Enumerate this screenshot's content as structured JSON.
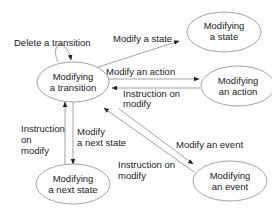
{
  "diagram": {
    "type": "state-transition",
    "colors": {
      "stroke": "#8a8a8a",
      "text": "#222222",
      "arrowhead": "#222222",
      "background": "#ffffff"
    },
    "nodes": [
      {
        "id": "transition",
        "line1": "Modifying",
        "line2": "a transition"
      },
      {
        "id": "state",
        "line1": "Modifying",
        "line2": "a state"
      },
      {
        "id": "action",
        "line1": "Modifying",
        "line2": "an action"
      },
      {
        "id": "next_state",
        "line1": "Modifying",
        "line2": "a next state"
      },
      {
        "id": "event",
        "line1": "Modifying",
        "line2": "an event"
      }
    ],
    "edges": [
      {
        "from": "transition",
        "to": "transition",
        "label": "Delete a transition"
      },
      {
        "from": "transition",
        "to": "state",
        "label": "Modify a state"
      },
      {
        "from": "transition",
        "to": "action",
        "label": "Modify an action"
      },
      {
        "from": "action",
        "to": "transition",
        "label_line1": "Instruction on",
        "label_line2": "modify"
      },
      {
        "from": "transition",
        "to": "next_state",
        "label_line1": "Modify",
        "label_line2": "a next state"
      },
      {
        "from": "next_state",
        "to": "transition",
        "label_line1": "Instruction",
        "label_line2": "on",
        "label_line3": "modify"
      },
      {
        "from": "transition",
        "to": "event",
        "label": "Modify an event"
      },
      {
        "from": "event",
        "to": "transition",
        "label_line1": "Instruction on",
        "label_line2": "modify"
      }
    ]
  }
}
